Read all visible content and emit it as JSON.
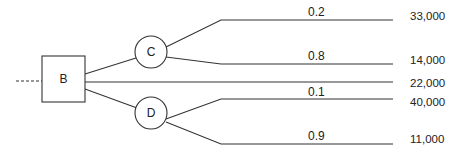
{
  "diagram": {
    "type": "decision-tree",
    "decision_node": {
      "label": "B",
      "shape": "square"
    },
    "chance_nodes": [
      {
        "label": "C",
        "shape": "circle"
      },
      {
        "label": "D",
        "shape": "circle"
      }
    ],
    "branches": [
      {
        "from": "C",
        "probability": "0.2",
        "payoff": "33,000"
      },
      {
        "from": "C",
        "probability": "0.8",
        "payoff": "14,000"
      },
      {
        "from": "B",
        "probability": "",
        "payoff": "22,000"
      },
      {
        "from": "D",
        "probability": "0.1",
        "payoff": "40,000"
      },
      {
        "from": "D",
        "probability": "0.9",
        "payoff": "11,000"
      }
    ]
  }
}
